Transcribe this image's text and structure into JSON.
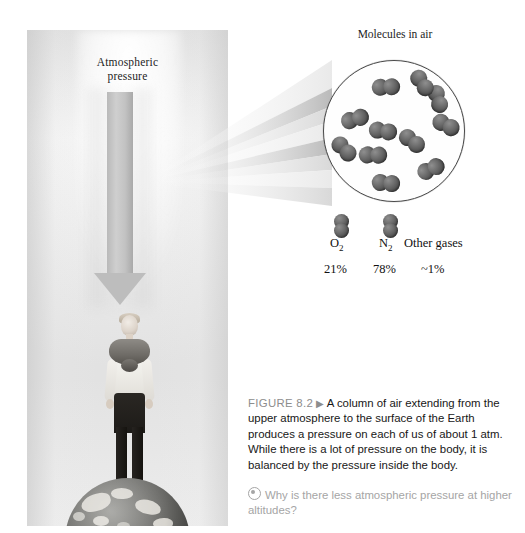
{
  "figure": {
    "number_label": "FIGURE 8.2",
    "arrow_glyph": "▶",
    "caption": "A column of air extending from the upper atmosphere to the surface of the Earth produces a pressure on each of us of about 1 atm. While there is a lot of pressure on the body, it is balanced by the pressure inside the body.",
    "question_icon": "circled-dot-icon",
    "question": "Why is there less atmospheric pressure at higher altitudes?"
  },
  "photo_panel": {
    "arrow_label_line1": "Atmospheric",
    "arrow_label_line2": "pressure",
    "arrow_icon": "down-arrow-icon",
    "person_alt": "person standing on globe",
    "globe_alt": "earth globe"
  },
  "magnifier": {
    "title": "Molecules in air",
    "cone_icon": "magnification-cone",
    "molecule_count": 11,
    "molecules": [
      {
        "x": 48,
        "y": 16,
        "rot": -18
      },
      {
        "x": 100,
        "y": 28,
        "rot": 58
      },
      {
        "x": 17,
        "y": 48,
        "rot": -32
      },
      {
        "x": 108,
        "y": 54,
        "rot": 12
      },
      {
        "x": 45,
        "y": 60,
        "rot": -6
      },
      {
        "x": 74,
        "y": 70,
        "rot": 22
      },
      {
        "x": 6,
        "y": 78,
        "rot": 30
      },
      {
        "x": 35,
        "y": 84,
        "rot": -14
      },
      {
        "x": 93,
        "y": 98,
        "rot": -40
      },
      {
        "x": 48,
        "y": 112,
        "rot": -10
      },
      {
        "x": 84,
        "y": 12,
        "rot": 40
      }
    ]
  },
  "legend": {
    "items": [
      {
        "name": "O",
        "sub": "2",
        "percent": "21%",
        "has_molecule": true
      },
      {
        "name": "N",
        "sub": "2",
        "percent": "78%",
        "has_molecule": true
      },
      {
        "name": "Other gases",
        "sub": "",
        "percent": "~1%",
        "has_molecule": false
      }
    ]
  },
  "colors": {
    "molecule_dark": "#4e4e4e",
    "caption_gray": "#8d8d8d",
    "question_gray": "#a5a5a5",
    "arrow_gray": "#bdbdbd",
    "page_background": "#ffffff"
  }
}
